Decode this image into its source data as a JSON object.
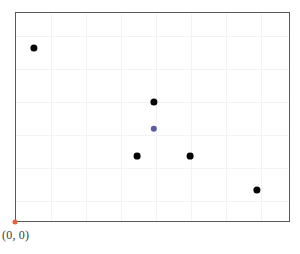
{
  "chart_data": {
    "type": "scatter",
    "title": "",
    "xlabel": "",
    "ylabel": "",
    "grid": true,
    "legend": null,
    "xlim": [
      0,
      275
    ],
    "ylim": [
      0,
      210
    ],
    "origin_label": "(0, 0)",
    "origin_point": {
      "x": 0,
      "y": 0
    },
    "axis_ticks": {
      "x": [
        35,
        70,
        105,
        140,
        175,
        210,
        245
      ],
      "y": [
        23,
        56,
        89,
        122,
        155,
        188
      ]
    },
    "series": [
      {
        "name": "points",
        "color": "#050505",
        "marker": "circle",
        "points": [
          {
            "x": 18,
            "y": 175,
            "px": 33,
            "py": 47,
            "r": 3.6
          },
          {
            "x": 138,
            "y": 121,
            "px": 153,
            "py": 101,
            "r": 3.6
          },
          {
            "x": 121,
            "y": 67,
            "px": 136,
            "py": 155,
            "r": 3.4
          },
          {
            "x": 174,
            "y": 67,
            "px": 189,
            "py": 155,
            "r": 3.4
          },
          {
            "x": 241,
            "y": 33,
            "px": 256,
            "py": 189,
            "r": 3.6
          }
        ]
      },
      {
        "name": "highlighted-point",
        "color": "#5b5ba8",
        "marker": "circle",
        "points": [
          {
            "x": 138,
            "y": 94,
            "px": 153,
            "py": 128,
            "r": 3.2
          }
        ]
      }
    ]
  },
  "plot": {
    "left": 15,
    "top": 12,
    "width": 275,
    "height": 210,
    "border_color": "#595959",
    "grid_color": "#f2f2f7",
    "background": "#ffffff"
  },
  "colors": {
    "point_black": "#050505",
    "point_blue": "#5b5ba8",
    "origin": "#e8603c",
    "border": "#595959",
    "grid": "#f2f2f7",
    "label_text": "#3a3a3a"
  },
  "origin": {
    "label": "(0, 0)",
    "marker_x": 15,
    "marker_y": 222,
    "label_x": 2,
    "label_y": 228
  }
}
